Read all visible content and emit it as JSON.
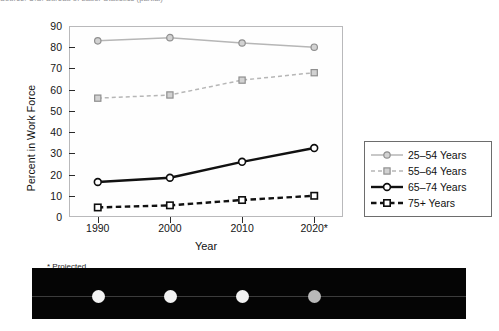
{
  "caption": {
    "text": "Source: U.S. Bureau of Labor Statistics (partial)"
  },
  "footnote": {
    "text": "* Projected"
  },
  "legend": {
    "position": "right",
    "entries": [
      {
        "label": "25–54 Years",
        "key": "light-solid-circle",
        "color": "#b6b6b6"
      },
      {
        "label": "55–64 Years",
        "key": "light-dashed-square",
        "color": "#b6b6b6"
      },
      {
        "label": "65–74 Years",
        "key": "dark-solid-circle",
        "color": "#111111"
      },
      {
        "label": "75+ Years",
        "key": "dark-dashed-square",
        "color": "#111111"
      }
    ]
  },
  "chart_data": {
    "type": "line",
    "title": "",
    "xlabel": "Year",
    "ylabel": "Percent in Work Force",
    "categories": [
      "1990",
      "2000",
      "2010",
      "2020*"
    ],
    "x": [
      1990,
      2000,
      2010,
      2020
    ],
    "xlim": [
      1985,
      2025
    ],
    "ylim": [
      0,
      90
    ],
    "yticks": [
      0,
      10,
      20,
      30,
      40,
      50,
      60,
      70,
      80,
      90
    ],
    "grid": false,
    "series": [
      {
        "name": "25–54 Years",
        "values": [
          83,
          84.5,
          82,
          80
        ],
        "color": "#b6b6b6",
        "line": "solid",
        "marker": "circle"
      },
      {
        "name": "55–64 Years",
        "values": [
          56,
          57.5,
          64.5,
          68
        ],
        "color": "#b6b6b6",
        "line": "dashed",
        "marker": "square"
      },
      {
        "name": "65–74 Years",
        "values": [
          16.5,
          18.5,
          26,
          32.5
        ],
        "color": "#111111",
        "line": "solid",
        "marker": "circle"
      },
      {
        "name": "75+ Years",
        "values": [
          4.5,
          5.5,
          8,
          10
        ],
        "color": "#111111",
        "line": "dashed",
        "marker": "square"
      }
    ]
  },
  "scan_strip": {
    "dot_count": 4,
    "dots": [
      "bright",
      "bright",
      "bright",
      "dim"
    ]
  }
}
